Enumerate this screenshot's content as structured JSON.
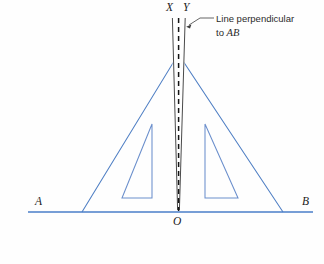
{
  "diagram": {
    "background_color": "#fefefe",
    "line_color": "#4f7fc4",
    "baseline_color": "#4a7ec9",
    "dash_color": "#1a1a1a",
    "text_color": "#2b2b2b",
    "labels": {
      "x": "X",
      "y": "Y",
      "a": "A",
      "b": "B",
      "o": "O"
    },
    "annotation": {
      "text_line_1": "Line perpendicular",
      "text_line_2_prefix": "to ",
      "text_line_2_italic": "AB"
    },
    "geometry": {
      "baseline": {
        "x1": 28,
        "y1": 212,
        "x2": 313,
        "y2": 212
      },
      "apex": {
        "x": 178,
        "y": 58
      },
      "left_foot": {
        "x": 82,
        "y": 212
      },
      "right_foot": {
        "x": 283,
        "y": 212
      },
      "vertical_edge_x": {
        "x": 172,
        "y_top": 18,
        "y_bottom": 212
      },
      "vertical_edge_y": {
        "x": 185,
        "y_top": 18,
        "y_bottom": 212
      },
      "dashed_line": {
        "x": 178.5,
        "y_top": 18,
        "y_bottom": 212
      },
      "inner_triangle_left": {
        "apex_x": 152,
        "apex_y": 124,
        "base_y": 198,
        "outer_x": 122
      },
      "inner_triangle_right": {
        "apex_x": 205,
        "apex_y": 124,
        "base_y": 198,
        "outer_x": 238
      },
      "leader": {
        "from_x": 186,
        "from_y": 25,
        "elbow_x": 200,
        "elbow_y": 18,
        "to_x": 214,
        "to_y": 18
      }
    }
  }
}
